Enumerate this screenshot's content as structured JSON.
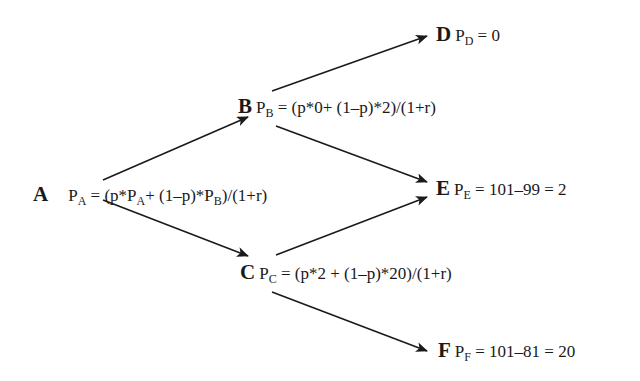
{
  "diagram": {
    "type": "binomial-tree",
    "nodes": [
      {
        "id": "A",
        "letter": "A",
        "p_sub": "A",
        "formula": " = (p*P",
        "f_sub1": "A",
        "formula2": "+ (1–p)*P",
        "f_sub2": "B",
        "formula3": ")/(1+r)"
      },
      {
        "id": "B",
        "letter": "B",
        "p_sub": "B",
        "formula": " = (p*0+ (1–p)*2)/(1+r)"
      },
      {
        "id": "C",
        "letter": "C",
        "p_sub": "C",
        "formula": " = (p*2 + (1–p)*20)/(1+r)"
      },
      {
        "id": "D",
        "letter": "D",
        "p_sub": "D",
        "formula": " = 0"
      },
      {
        "id": "E",
        "letter": "E",
        "p_sub": "E",
        "formula": " = 101–99 = 2"
      },
      {
        "id": "F",
        "letter": "F",
        "p_sub": "F",
        "formula": " = 101–81 = 20"
      }
    ],
    "p_label": "P",
    "edges": [
      {
        "from": "A",
        "to": "B"
      },
      {
        "from": "A",
        "to": "C"
      },
      {
        "from": "B",
        "to": "D"
      },
      {
        "from": "B",
        "to": "E"
      },
      {
        "from": "C",
        "to": "E"
      },
      {
        "from": "C",
        "to": "F"
      }
    ],
    "colors": {
      "line": "#1a1a1a",
      "background": "#ffffff"
    }
  }
}
